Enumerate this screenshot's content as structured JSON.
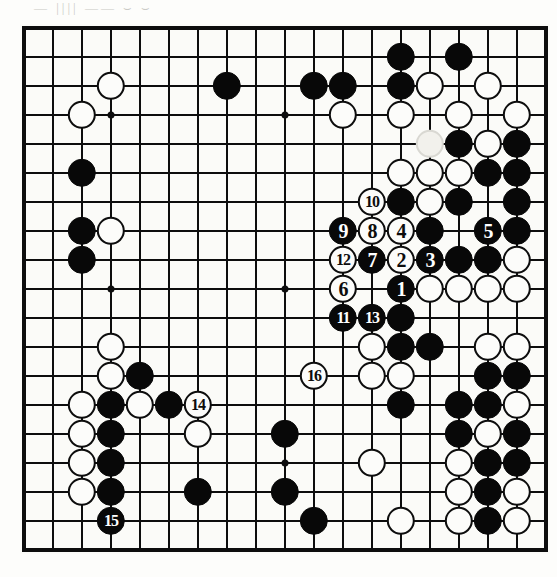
{
  "page": {
    "kind": "go-game-diagram",
    "scan_marks": "—  ||||  ——   ⌣  ⌣"
  },
  "board": {
    "size": 19,
    "origin_x": 24,
    "origin_y": 28,
    "spacing": 29,
    "stone_radius": 14.2,
    "line_color": "#0d0d0d",
    "board_color": "#fbfbf8",
    "black_color": "#080808",
    "white_color": "#fcfcfa",
    "star_points": [
      [
        3,
        3
      ],
      [
        9,
        3
      ],
      [
        15,
        3
      ],
      [
        3,
        9
      ],
      [
        9,
        9
      ],
      [
        15,
        9
      ],
      [
        3,
        15
      ],
      [
        9,
        15
      ],
      [
        15,
        15
      ]
    ],
    "stones": [
      {
        "c": 13,
        "r": 1,
        "color": "b"
      },
      {
        "c": 15,
        "r": 1,
        "color": "b"
      },
      {
        "c": 3,
        "r": 2,
        "color": "w"
      },
      {
        "c": 7,
        "r": 2,
        "color": "b"
      },
      {
        "c": 10,
        "r": 2,
        "color": "b"
      },
      {
        "c": 11,
        "r": 2,
        "color": "b"
      },
      {
        "c": 13,
        "r": 2,
        "color": "b"
      },
      {
        "c": 14,
        "r": 2,
        "color": "w"
      },
      {
        "c": 16,
        "r": 2,
        "color": "w"
      },
      {
        "c": 2,
        "r": 3,
        "color": "w"
      },
      {
        "c": 11,
        "r": 3,
        "color": "w"
      },
      {
        "c": 13,
        "r": 3,
        "color": "w"
      },
      {
        "c": 15,
        "r": 3,
        "color": "w"
      },
      {
        "c": 17,
        "r": 3,
        "color": "w"
      },
      {
        "c": 14,
        "r": 4,
        "color": "ghost"
      },
      {
        "c": 15,
        "r": 4,
        "color": "b"
      },
      {
        "c": 16,
        "r": 4,
        "color": "w"
      },
      {
        "c": 17,
        "r": 4,
        "color": "b"
      },
      {
        "c": 2,
        "r": 5,
        "color": "b"
      },
      {
        "c": 13,
        "r": 5,
        "color": "w"
      },
      {
        "c": 14,
        "r": 5,
        "color": "w"
      },
      {
        "c": 15,
        "r": 5,
        "color": "w"
      },
      {
        "c": 16,
        "r": 5,
        "color": "b"
      },
      {
        "c": 17,
        "r": 5,
        "color": "b"
      },
      {
        "c": 12,
        "r": 6,
        "color": "w",
        "label": "10"
      },
      {
        "c": 13,
        "r": 6,
        "color": "b"
      },
      {
        "c": 14,
        "r": 6,
        "color": "w"
      },
      {
        "c": 15,
        "r": 6,
        "color": "b"
      },
      {
        "c": 17,
        "r": 6,
        "color": "b"
      },
      {
        "c": 2,
        "r": 7,
        "color": "b"
      },
      {
        "c": 3,
        "r": 7,
        "color": "w"
      },
      {
        "c": 11,
        "r": 7,
        "color": "b",
        "label": "9"
      },
      {
        "c": 12,
        "r": 7,
        "color": "w",
        "label": "8"
      },
      {
        "c": 13,
        "r": 7,
        "color": "w",
        "label": "4"
      },
      {
        "c": 14,
        "r": 7,
        "color": "b"
      },
      {
        "c": 16,
        "r": 7,
        "color": "b",
        "label": "5"
      },
      {
        "c": 17,
        "r": 7,
        "color": "b"
      },
      {
        "c": 2,
        "r": 8,
        "color": "b"
      },
      {
        "c": 11,
        "r": 8,
        "color": "w",
        "label": "12"
      },
      {
        "c": 12,
        "r": 8,
        "color": "b",
        "label": "7"
      },
      {
        "c": 13,
        "r": 8,
        "color": "w",
        "label": "2"
      },
      {
        "c": 14,
        "r": 8,
        "color": "b",
        "label": "3"
      },
      {
        "c": 15,
        "r": 8,
        "color": "b"
      },
      {
        "c": 16,
        "r": 8,
        "color": "b"
      },
      {
        "c": 17,
        "r": 8,
        "color": "w"
      },
      {
        "c": 11,
        "r": 9,
        "color": "w",
        "label": "6"
      },
      {
        "c": 13,
        "r": 9,
        "color": "b",
        "label": "1"
      },
      {
        "c": 14,
        "r": 9,
        "color": "w"
      },
      {
        "c": 15,
        "r": 9,
        "color": "w"
      },
      {
        "c": 16,
        "r": 9,
        "color": "w"
      },
      {
        "c": 17,
        "r": 9,
        "color": "w"
      },
      {
        "c": 11,
        "r": 10,
        "color": "b",
        "label": "11"
      },
      {
        "c": 12,
        "r": 10,
        "color": "b",
        "label": "13"
      },
      {
        "c": 13,
        "r": 10,
        "color": "b"
      },
      {
        "c": 12,
        "r": 11,
        "color": "w"
      },
      {
        "c": 13,
        "r": 11,
        "color": "b"
      },
      {
        "c": 14,
        "r": 11,
        "color": "b"
      },
      {
        "c": 16,
        "r": 11,
        "color": "w"
      },
      {
        "c": 17,
        "r": 11,
        "color": "w"
      },
      {
        "c": 3,
        "r": 11,
        "color": "w"
      },
      {
        "c": 3,
        "r": 12,
        "color": "w"
      },
      {
        "c": 4,
        "r": 12,
        "color": "b"
      },
      {
        "c": 10,
        "r": 12,
        "color": "w",
        "label": "16"
      },
      {
        "c": 12,
        "r": 12,
        "color": "w"
      },
      {
        "c": 13,
        "r": 12,
        "color": "w"
      },
      {
        "c": 16,
        "r": 12,
        "color": "b"
      },
      {
        "c": 17,
        "r": 12,
        "color": "b"
      },
      {
        "c": 2,
        "r": 13,
        "color": "w"
      },
      {
        "c": 3,
        "r": 13,
        "color": "b"
      },
      {
        "c": 4,
        "r": 13,
        "color": "w"
      },
      {
        "c": 5,
        "r": 13,
        "color": "b"
      },
      {
        "c": 6,
        "r": 13,
        "color": "w",
        "label": "14"
      },
      {
        "c": 13,
        "r": 13,
        "color": "b"
      },
      {
        "c": 15,
        "r": 13,
        "color": "b"
      },
      {
        "c": 16,
        "r": 13,
        "color": "b"
      },
      {
        "c": 17,
        "r": 13,
        "color": "w"
      },
      {
        "c": 2,
        "r": 14,
        "color": "w"
      },
      {
        "c": 3,
        "r": 14,
        "color": "b"
      },
      {
        "c": 6,
        "r": 14,
        "color": "w"
      },
      {
        "c": 9,
        "r": 14,
        "color": "b"
      },
      {
        "c": 15,
        "r": 14,
        "color": "b"
      },
      {
        "c": 16,
        "r": 14,
        "color": "w"
      },
      {
        "c": 17,
        "r": 14,
        "color": "b"
      },
      {
        "c": 2,
        "r": 15,
        "color": "w"
      },
      {
        "c": 3,
        "r": 15,
        "color": "b"
      },
      {
        "c": 12,
        "r": 15,
        "color": "w"
      },
      {
        "c": 15,
        "r": 15,
        "color": "w"
      },
      {
        "c": 16,
        "r": 15,
        "color": "b"
      },
      {
        "c": 17,
        "r": 15,
        "color": "b"
      },
      {
        "c": 2,
        "r": 16,
        "color": "w"
      },
      {
        "c": 3,
        "r": 16,
        "color": "b"
      },
      {
        "c": 6,
        "r": 16,
        "color": "b"
      },
      {
        "c": 9,
        "r": 16,
        "color": "b"
      },
      {
        "c": 15,
        "r": 16,
        "color": "w"
      },
      {
        "c": 16,
        "r": 16,
        "color": "b"
      },
      {
        "c": 17,
        "r": 16,
        "color": "w"
      },
      {
        "c": 3,
        "r": 17,
        "color": "b",
        "label": "15"
      },
      {
        "c": 10,
        "r": 17,
        "color": "b"
      },
      {
        "c": 13,
        "r": 17,
        "color": "w"
      },
      {
        "c": 15,
        "r": 17,
        "color": "w"
      },
      {
        "c": 16,
        "r": 17,
        "color": "b"
      },
      {
        "c": 17,
        "r": 17,
        "color": "w"
      }
    ]
  },
  "moves": {
    "sequence": [
      {
        "n": "1",
        "color": "b",
        "c": 13,
        "r": 9
      },
      {
        "n": "2",
        "color": "w",
        "c": 13,
        "r": 8
      },
      {
        "n": "3",
        "color": "b",
        "c": 14,
        "r": 8
      },
      {
        "n": "4",
        "color": "w",
        "c": 13,
        "r": 7
      },
      {
        "n": "5",
        "color": "b",
        "c": 16,
        "r": 7
      },
      {
        "n": "6",
        "color": "w",
        "c": 11,
        "r": 9
      },
      {
        "n": "7",
        "color": "b",
        "c": 12,
        "r": 8
      },
      {
        "n": "8",
        "color": "w",
        "c": 12,
        "r": 7
      },
      {
        "n": "9",
        "color": "b",
        "c": 11,
        "r": 7
      },
      {
        "n": "10",
        "color": "w",
        "c": 12,
        "r": 6
      },
      {
        "n": "11",
        "color": "b",
        "c": 11,
        "r": 10
      },
      {
        "n": "12",
        "color": "w",
        "c": 11,
        "r": 8
      },
      {
        "n": "13",
        "color": "b",
        "c": 12,
        "r": 10
      },
      {
        "n": "14",
        "color": "w",
        "c": 6,
        "r": 13
      },
      {
        "n": "15",
        "color": "b",
        "c": 3,
        "r": 17
      },
      {
        "n": "16",
        "color": "w",
        "c": 10,
        "r": 12
      }
    ]
  }
}
